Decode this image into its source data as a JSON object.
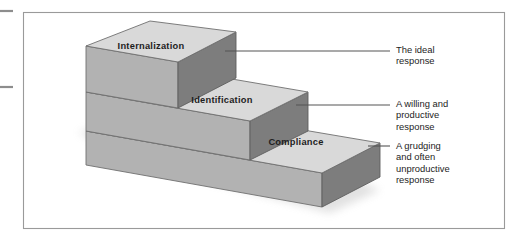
{
  "figure": {
    "type": "isometric-staircase-diagram",
    "title": "",
    "frame": {
      "x": 23,
      "y": 12,
      "width": 482,
      "height": 217,
      "border_color": "#9a9a9a",
      "background": "#ffffff"
    },
    "palette": {
      "top_face": "#d9d9d9",
      "front_face": "#b2b2b2",
      "side_face": "#7d7d7d",
      "edge": "#6f6f6f",
      "leader_line": "#555555",
      "label_text": "#1d1d1d",
      "page_edge_mark": "#8d8d8d"
    },
    "page_edge_marks": [
      {
        "x1": 0,
        "y1": 11,
        "x2": 13,
        "y2": 11
      },
      {
        "x1": 0,
        "y1": 87,
        "x2": 13,
        "y2": 87
      }
    ]
  },
  "steps": [
    {
      "id": "internalization",
      "label": "Internalization",
      "level": 3,
      "label_x": 151,
      "label_y": 49,
      "leader": {
        "x1": 225,
        "y1": 51,
        "x2": 390,
        "y2": 51
      }
    },
    {
      "id": "identification",
      "label": "Identification",
      "level": 2,
      "label_x": 222,
      "label_y": 103,
      "leader": {
        "x1": 296,
        "y1": 105,
        "x2": 390,
        "y2": 105
      }
    },
    {
      "id": "compliance",
      "label": "Compliance",
      "level": 1,
      "label_x": 296,
      "label_y": 145,
      "leader": {
        "x1": 368,
        "y1": 146,
        "x2": 390,
        "y2": 146
      }
    }
  ],
  "callouts": [
    {
      "id": "callout-internalization",
      "text": "The ideal\nresponse"
    },
    {
      "id": "callout-identification",
      "text": "A willing and\nproductive\nresponse"
    },
    {
      "id": "callout-compliance",
      "text": "A grudging\nand often\nunproductive\nresponse"
    }
  ]
}
